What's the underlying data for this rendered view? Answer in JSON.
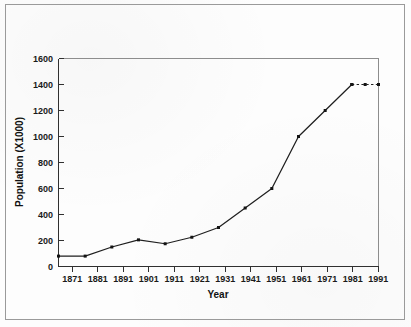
{
  "figure": {
    "background_color": "#fdfdfd",
    "frame_color": "#9a9a9a",
    "line_color": "#1f1f1f",
    "axis_color": "#303030"
  },
  "chart_data": {
    "type": "line",
    "title": "",
    "subtitle": "",
    "xlabel": "Year",
    "ylabel": "Population (X1000)",
    "xlim": [
      1871,
      1991
    ],
    "ylim": [
      0,
      1600
    ],
    "xticks": [
      1871,
      1881,
      1891,
      1901,
      1911,
      1921,
      1931,
      1941,
      1951,
      1961,
      1971,
      1981,
      1991
    ],
    "xtick_labels": [
      "1871",
      "1881",
      "1891",
      "1901",
      "1911",
      "1921",
      "1931",
      "1941",
      "1951",
      "1961",
      "1971",
      "1981",
      "1991"
    ],
    "yticks": [
      0,
      200,
      400,
      600,
      800,
      1000,
      1200,
      1400,
      1600
    ],
    "ytick_labels": [
      "0",
      "200",
      "400",
      "600",
      "800",
      "1000",
      "1200",
      "1400",
      "1600"
    ],
    "grid": false,
    "legend": null,
    "legend_position": "none",
    "markers": "square",
    "series": [
      {
        "name": "Population",
        "style": "solid",
        "x": [
          1871,
          1881,
          1891,
          1901,
          1911,
          1921,
          1931,
          1941,
          1951,
          1961,
          1971,
          1981
        ],
        "values": [
          80,
          80,
          150,
          205,
          175,
          225,
          300,
          450,
          600,
          1000,
          1200,
          1400
        ]
      },
      {
        "name": "Projection",
        "style": "dashed",
        "x": [
          1981,
          1986,
          1991
        ],
        "values": [
          1400,
          1400,
          1400
        ]
      }
    ],
    "annotations": []
  }
}
